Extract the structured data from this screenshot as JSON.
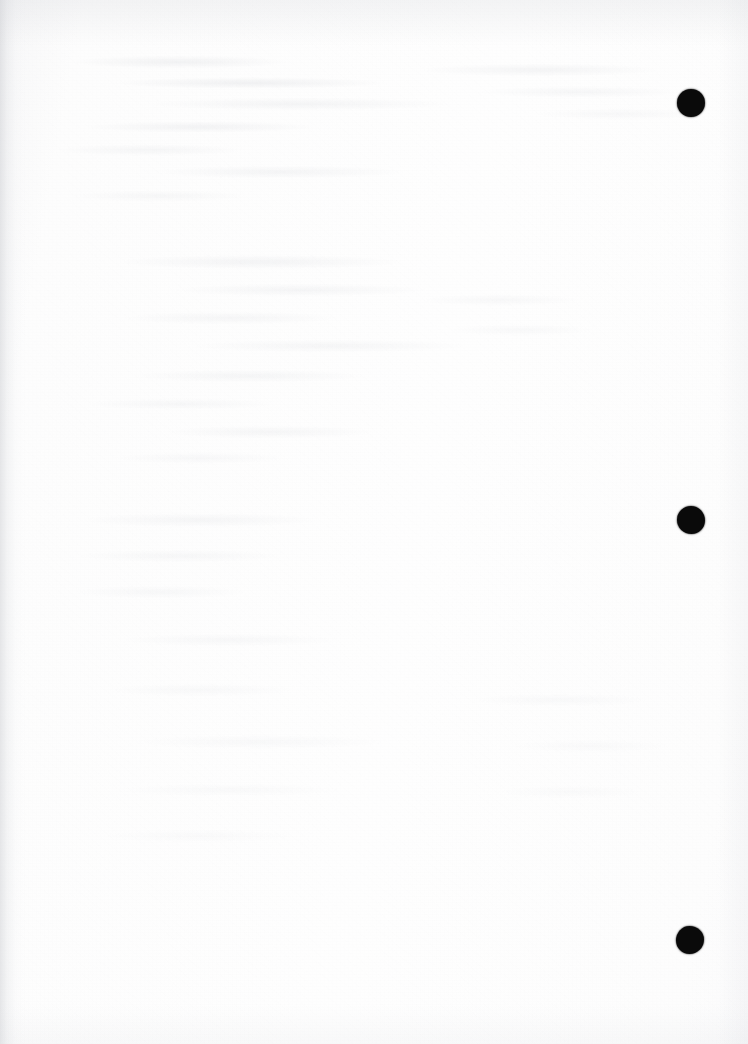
{
  "document": {
    "kind": "scanned-page",
    "page_state": "blank",
    "orientation": "portrait",
    "width_px": 748,
    "height_px": 1044,
    "visible_text": "",
    "background_color": "#fdfdfd",
    "paper_tone": "#fbfbfc",
    "gutter_shadow_color": "#c4c6cb",
    "bleed_through_color": "#b0b3bb",
    "description": "Blank scanned sheet with three-hole-punch marks along the right margin and faint reverse-side show-through."
  },
  "marks": {
    "label": "hole-punch-marks",
    "color": "#0a0a0a",
    "count": 3,
    "items": [
      {
        "name": "punch-mark-top",
        "cx": 691,
        "cy": 103,
        "d": 28
      },
      {
        "name": "punch-mark-middle",
        "cx": 691,
        "cy": 520,
        "d": 28
      },
      {
        "name": "punch-mark-bottom",
        "cx": 690,
        "cy": 940,
        "d": 28
      }
    ]
  },
  "edges": {
    "gutter": "left-edge-shadow",
    "top": "top-edge-falloff",
    "right": "right-edge-falloff",
    "bottom": "bottom-edge-falloff"
  }
}
